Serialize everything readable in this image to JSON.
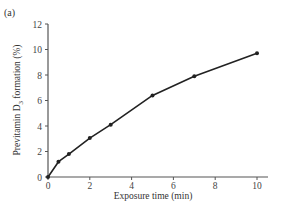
{
  "chart_data": {
    "type": "line",
    "panel_label": "(a)",
    "title": "",
    "xlabel": "Exposure time (min)",
    "ylabel": "Previtamin D3 formation (%)",
    "ylabel_parts": {
      "pre": "Previtamin D",
      "sub": "3",
      "post": " formation (%)"
    },
    "xlim": [
      0,
      10
    ],
    "ylim": [
      0,
      12
    ],
    "xticks": [
      0,
      2,
      4,
      6,
      8,
      10
    ],
    "yticks": [
      0,
      2,
      4,
      6,
      8,
      10,
      12
    ],
    "grid": false,
    "legend": null,
    "series": [
      {
        "name": "Previtamin D3",
        "marker": "circle",
        "color": "#222222",
        "x": [
          0,
          0.5,
          1,
          2,
          3,
          5,
          7,
          10
        ],
        "y": [
          0,
          1.2,
          1.8,
          3.05,
          4.1,
          6.4,
          7.9,
          9.7
        ]
      }
    ]
  }
}
